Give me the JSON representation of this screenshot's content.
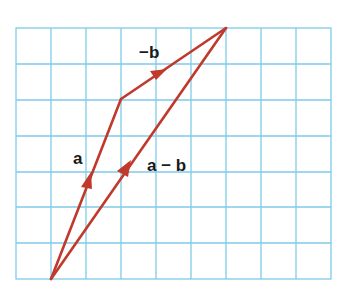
{
  "diagram": {
    "title": "",
    "grid": {
      "cols": 9,
      "rows": 7,
      "color": "#7fcbe8"
    },
    "vector_color": "#c0392b",
    "labels": {
      "a": "a",
      "neg_b": "−b",
      "a_minus_b": "a − b"
    },
    "vectors": [
      {
        "name": "a",
        "from": [
          1,
          0
        ],
        "to": [
          3,
          5
        ]
      },
      {
        "name": "-b",
        "from": [
          3,
          5
        ],
        "to": [
          6,
          7
        ]
      },
      {
        "name": "a-b",
        "from": [
          1,
          0
        ],
        "to": [
          6,
          7
        ]
      }
    ]
  }
}
